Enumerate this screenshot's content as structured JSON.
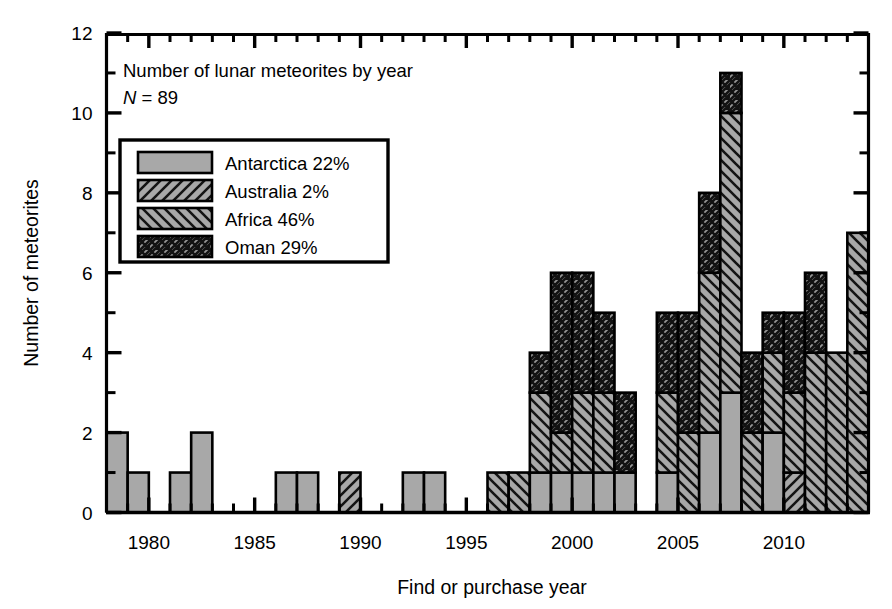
{
  "chart_data": {
    "type": "bar",
    "subtype": "stacked-histogram",
    "title": "Number of lunar meteorites by year",
    "annotation_n": "N = 89",
    "xlabel": "Find or purchase year",
    "ylabel": "Number of meteorites",
    "xlim": [
      1978,
      2014
    ],
    "ylim": [
      0,
      12
    ],
    "ytick_major_step": 2,
    "ytick_minor_step": 1,
    "xtick_major_step": 5,
    "xtick_minor_step": 1,
    "ytick_labels": [
      "0",
      "2",
      "4",
      "6",
      "8",
      "10",
      "12"
    ],
    "xtick_labels": [
      "1980",
      "1985",
      "1990",
      "1995",
      "2000",
      "2005",
      "2010"
    ],
    "xtick_label_values": [
      1980,
      1985,
      1990,
      1995,
      2000,
      2005,
      2010
    ],
    "grid": false,
    "legend_position": "upper-left-inset",
    "series": [
      {
        "name": "Antarctica",
        "share_label": "Antarctica 22%",
        "share_percent": 22,
        "pattern": "solid-gray",
        "fill": "#a8a8a8",
        "values": [
          2,
          1,
          0,
          1,
          2,
          0,
          0,
          0,
          1,
          1,
          0,
          0,
          0,
          0,
          1,
          1,
          0,
          0,
          0,
          0,
          1,
          1,
          1,
          1,
          1,
          0,
          1,
          0,
          2,
          3,
          0,
          2,
          0,
          0,
          0,
          0
        ]
      },
      {
        "name": "Australia",
        "share_label": "Australia 2%",
        "share_percent": 2,
        "pattern": "diagonal-forward",
        "fill": "#a8a8a8",
        "values": [
          0,
          0,
          0,
          0,
          0,
          0,
          0,
          0,
          0,
          0,
          0,
          1,
          0,
          0,
          0,
          0,
          0,
          0,
          0,
          0,
          0,
          0,
          0,
          0,
          0,
          0,
          0,
          0,
          0,
          0,
          0,
          0,
          1,
          0,
          0,
          0
        ]
      },
      {
        "name": "Africa",
        "share_label": "Africa 46%",
        "share_percent": 46,
        "pattern": "diagonal-backward",
        "fill": "#a8a8a8",
        "values": [
          0,
          0,
          0,
          0,
          0,
          0,
          0,
          0,
          0,
          0,
          0,
          0,
          0,
          0,
          0,
          0,
          0,
          0,
          1,
          1,
          2,
          1,
          2,
          2,
          0,
          0,
          2,
          2,
          4,
          7,
          2,
          2,
          2,
          4,
          4,
          7
        ]
      },
      {
        "name": "Oman",
        "share_label": "Oman 29%",
        "share_percent": 29,
        "pattern": "crosshatch",
        "fill": "#8f8f8f",
        "values": [
          0,
          0,
          0,
          0,
          0,
          0,
          0,
          0,
          0,
          0,
          0,
          0,
          0,
          0,
          0,
          0,
          0,
          0,
          0,
          0,
          1,
          4,
          3,
          2,
          2,
          0,
          2,
          3,
          2,
          1,
          2,
          1,
          2,
          2,
          0,
          0
        ]
      }
    ],
    "years": [
      1978,
      1979,
      1980,
      1981,
      1982,
      1983,
      1984,
      1985,
      1986,
      1987,
      1988,
      1989,
      1990,
      1991,
      1992,
      1993,
      1994,
      1995,
      1996,
      1997,
      1998,
      1999,
      2000,
      2001,
      2002,
      2003,
      2004,
      2005,
      2006,
      2007,
      2008,
      2009,
      2010,
      2011,
      2012,
      2013
    ],
    "totals": [
      2,
      1,
      0,
      1,
      2,
      0,
      0,
      0,
      1,
      1,
      0,
      1,
      0,
      0,
      1,
      1,
      0,
      0,
      1,
      1,
      4,
      6,
      5,
      2,
      4,
      5,
      8,
      11,
      4,
      5,
      5,
      6,
      4,
      7,
      0,
      0
    ]
  },
  "axis": {
    "ylabel": "Number of meteorites",
    "xlabel": "Find or purchase year"
  },
  "legend": {
    "items": [
      {
        "label": "Antarctica 22%",
        "pattern": "solid-gray"
      },
      {
        "label": "Australia 2%",
        "pattern": "diagonal-forward"
      },
      {
        "label": "Africa 46%",
        "pattern": "diagonal-backward"
      },
      {
        "label": "Oman 29%",
        "pattern": "crosshatch"
      }
    ]
  },
  "annotations": {
    "title": "Number of lunar meteorites by year",
    "n_italic": "N",
    "n_rest": " = 89"
  },
  "colors": {
    "fill_gray": "#a8a8a8",
    "fill_gray_dark": "#8f8f8f",
    "stroke": "#000000",
    "background": "#ffffff"
  }
}
